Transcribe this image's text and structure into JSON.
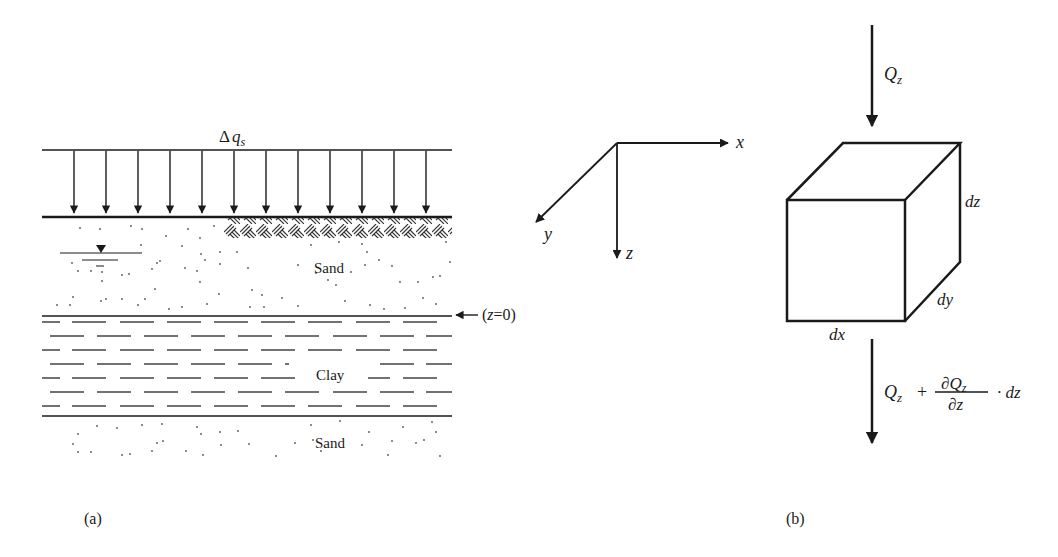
{
  "figure": {
    "panel_a": {
      "caption": "(a)",
      "load_label_delta": "Δ",
      "load_label_q": "q",
      "load_label_sub": "s",
      "load_arrow_count": 12,
      "layers": [
        {
          "name": "Sand",
          "type": "sand",
          "note": "upper layer with surface fill (hatched) on right and water table on left"
        },
        {
          "name": "Clay",
          "type": "clay"
        },
        {
          "name": "Sand",
          "type": "sand"
        }
      ],
      "upper_sand_label": "Sand",
      "clay_label": "Clay",
      "lower_sand_label": "Sand",
      "datum_label": "(z=0)",
      "datum_label_open": "(",
      "datum_label_z": "z",
      "datum_label_rest": "=0)",
      "water_table_symbol": "▼"
    },
    "axes": {
      "x_label": "x",
      "y_label": "y",
      "z_label": "z"
    },
    "panel_b": {
      "caption": "(b)",
      "inflow_Q": "Q",
      "inflow_sub": "z",
      "edge_dx": "dx",
      "edge_dy": "dy",
      "edge_dz": "dz",
      "outflow_Q": "Q",
      "outflow_sub": "z",
      "outflow_plus": "+",
      "outflow_num": "∂Q",
      "outflow_num_sub": "z",
      "outflow_den": "∂z",
      "outflow_tail": "· dz"
    },
    "colors": {
      "ink": "#1a1a1a",
      "background": "#ffffff"
    }
  }
}
